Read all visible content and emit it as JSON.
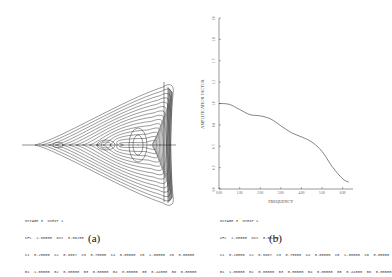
{
  "figure": {
    "panels": [
      {
        "id": "a",
        "caption": "(a)",
        "type": "contour",
        "params": [
          "NSTAGE 3  NSHIP 1",
          "CFL  2.80000  DIS  0.06250",
          "C1  0.25000  C2  0.6667  C3  0.75000  C4  0.00000  C5  1.00000  C6  0.00000",
          "B1  1.00000  B2  0.00000  B3  0.50000  B4  0.00000  B5  0.44000  B6  0.00000"
        ]
      },
      {
        "id": "b",
        "caption": "(b)",
        "type": "line",
        "params": [
          "NSTAGE 3  NSHIP 1",
          "CFL  2.80000  DIS  0.06250",
          "C1  0.25000  C2  0.6667  C3  0.75000  C4  0.00000  C5  1.00000  C6  0.00000",
          "B1  1.00000  B2  0.00000  B3  0.50000  B4  0.00000  B5  0.44000  B6  0.00000"
        ]
      }
    ]
  },
  "chart_data": [
    {
      "type": "contour",
      "title": "",
      "panel": "(a)",
      "description": "Contour plot of amplification factor in the complex plane; bow/fan-shaped stability region with nested closed contours",
      "xlabel": "",
      "ylabel": "",
      "grid": false
    },
    {
      "type": "line",
      "title": "",
      "panel": "(b)",
      "xlabel": "FREQUENCY",
      "ylabel": "AMPLIFICATION FACTOR",
      "x_ticks": [
        "0.00",
        "1.00",
        "2.00",
        "3.00",
        "4.00",
        "5.00",
        "6.00"
      ],
      "y_ticks": [
        "0.0",
        "0.2",
        "0.5",
        "0.8",
        "1.0",
        "1.2",
        "1.5",
        "1.8",
        "2.0"
      ],
      "xlim": [
        0,
        6.5
      ],
      "ylim": [
        0,
        2.0
      ],
      "grid": false,
      "x": [
        0.0,
        0.5,
        1.0,
        1.5,
        2.0,
        2.5,
        3.0,
        3.5,
        4.0,
        4.5,
        5.0,
        5.5,
        6.0,
        6.3
      ],
      "series": [
        {
          "name": "amplification factor",
          "values": [
            1.0,
            0.99,
            0.93,
            0.87,
            0.855,
            0.82,
            0.74,
            0.66,
            0.61,
            0.55,
            0.44,
            0.26,
            0.12,
            0.08
          ]
        }
      ]
    }
  ]
}
